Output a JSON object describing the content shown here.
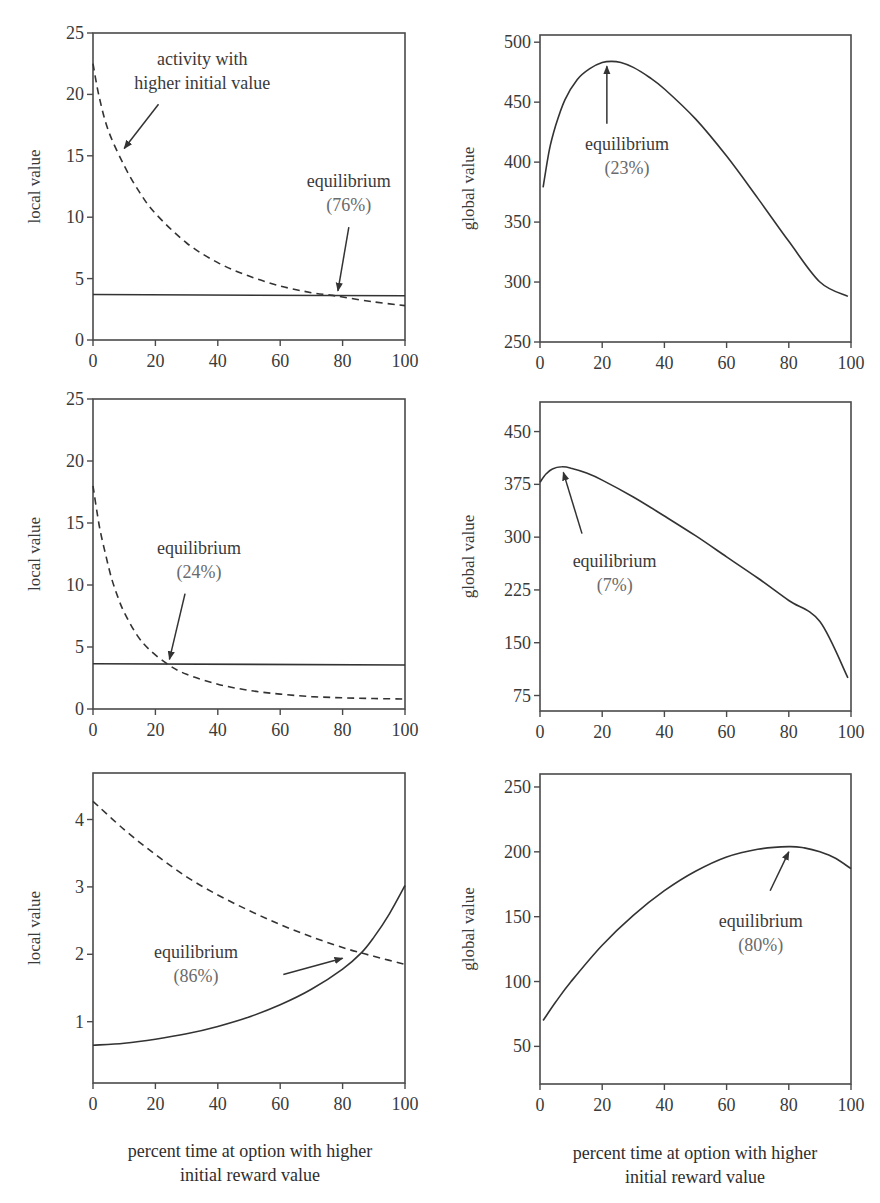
{
  "figure": {
    "x_caption_line1": "percent time at option with higher",
    "x_caption_line2": "initial reward value"
  },
  "chart_data": [
    {
      "id": "top-left",
      "type": "line",
      "title": "",
      "xlabel": "percent time at option with higher initial reward value",
      "ylabel": "local value",
      "xlim": [
        0,
        100
      ],
      "ylim": [
        0,
        25
      ],
      "xticks": [
        0,
        20,
        40,
        60,
        80,
        100
      ],
      "yticks": [
        0,
        5,
        10,
        15,
        20,
        25
      ],
      "grid": false,
      "series": [
        {
          "name": "activity with higher initial value",
          "style": "dashed",
          "x": [
            0,
            2,
            5,
            10,
            15,
            20,
            30,
            40,
            50,
            60,
            70,
            76,
            80,
            90,
            100
          ],
          "y": [
            22.5,
            19.8,
            17.0,
            14.2,
            12.0,
            10.3,
            7.9,
            6.3,
            5.2,
            4.4,
            3.85,
            3.66,
            3.5,
            3.1,
            2.8
          ]
        },
        {
          "name": "other activity",
          "style": "solid",
          "x": [
            0,
            100
          ],
          "y": [
            3.7,
            3.6
          ]
        }
      ],
      "annotations": [
        {
          "text": "activity with",
          "text2": "higher initial value",
          "tx": 35,
          "ty": 22.4,
          "ax": 21,
          "ay": 19.2,
          "hx": 10,
          "hy": 15.6
        },
        {
          "text": "equilibrium",
          "text2": "(76%)",
          "tx": 82,
          "ty": 12.5,
          "ax": 82,
          "ay": 9.2,
          "hx": 78.5,
          "hy": 4.0
        }
      ],
      "box": {
        "left": 93,
        "top": 33,
        "width": 312,
        "height": 307
      }
    },
    {
      "id": "top-right",
      "type": "line",
      "title": "",
      "xlabel": "percent time at option with higher initial reward value",
      "ylabel": "global value",
      "xlim": [
        0,
        100
      ],
      "ylim": [
        250,
        506
      ],
      "xticks": [
        0,
        20,
        40,
        60,
        80,
        100
      ],
      "yticks": [
        250,
        300,
        350,
        400,
        450,
        500
      ],
      "grid": false,
      "series": [
        {
          "name": "global value",
          "style": "solid",
          "x": [
            1,
            3,
            5,
            8,
            12,
            16,
            20,
            23,
            26,
            30,
            35,
            40,
            50,
            60,
            70,
            80,
            90,
            99
          ],
          "y": [
            379,
            410,
            430,
            452,
            469,
            478,
            483,
            484,
            483,
            479,
            471,
            461,
            436,
            405,
            370,
            334,
            300,
            288
          ]
        },
        {
          "name": "",
          "style": "none",
          "x": [],
          "y": []
        }
      ],
      "annotations": [
        {
          "text": "equilibrium",
          "text2": "(23%)",
          "tx": 28,
          "ty": 410,
          "ax": 21.5,
          "ay": 432,
          "hx": 21.5,
          "hy": 480,
          "arrowhead": "up"
        }
      ],
      "box": {
        "left": 540,
        "top": 35,
        "width": 311,
        "height": 307
      }
    },
    {
      "id": "middle-left",
      "type": "line",
      "title": "",
      "xlabel": "percent time at option with higher initial reward value",
      "ylabel": "local value",
      "xlim": [
        0,
        100
      ],
      "ylim": [
        0,
        25
      ],
      "xticks": [
        0,
        20,
        40,
        60,
        80,
        100
      ],
      "yticks": [
        0,
        5,
        10,
        15,
        20,
        25
      ],
      "grid": false,
      "series": [
        {
          "name": "activity with higher initial value",
          "style": "dashed",
          "x": [
            0,
            2,
            4,
            6,
            8,
            10,
            14,
            18,
            24,
            30,
            40,
            50,
            60,
            70,
            80,
            90,
            100
          ],
          "y": [
            18.0,
            14.8,
            12.5,
            10.5,
            9.0,
            7.8,
            6.0,
            4.8,
            3.6,
            2.8,
            2.0,
            1.5,
            1.2,
            1.0,
            0.9,
            0.85,
            0.8
          ]
        },
        {
          "name": "other activity",
          "style": "solid",
          "x": [
            0,
            100
          ],
          "y": [
            3.65,
            3.55
          ]
        }
      ],
      "annotations": [
        {
          "text": "equilibrium",
          "text2": "(24%)",
          "tx": 34,
          "ty": 12.5,
          "ax": 29.5,
          "ay": 9.3,
          "hx": 24.5,
          "hy": 4.0
        }
      ],
      "box": {
        "left": 93,
        "top": 399,
        "width": 312,
        "height": 310
      }
    },
    {
      "id": "middle-right",
      "type": "line",
      "title": "",
      "xlabel": "percent time at option with higher initial reward value",
      "ylabel": "global value",
      "xlim": [
        0,
        100
      ],
      "ylim": [
        53,
        492
      ],
      "xticks": [
        0,
        20,
        40,
        60,
        80,
        100
      ],
      "yticks": [
        75,
        150,
        225,
        300,
        375,
        450
      ],
      "grid": false,
      "series": [
        {
          "name": "global value",
          "style": "solid",
          "x": [
            0,
            2,
            4,
            7,
            10,
            15,
            20,
            30,
            40,
            50,
            60,
            70,
            80,
            90,
            99
          ],
          "y": [
            378,
            390,
            397,
            400,
            398,
            391,
            381,
            357,
            330,
            302,
            272,
            242,
            210,
            180,
            100
          ]
        },
        {
          "name": "",
          "style": "none",
          "x": [],
          "y": []
        }
      ],
      "annotations": [
        {
          "text": "equilibrium",
          "text2": "(7%)",
          "tx": 24,
          "ty": 258,
          "ax": 13.5,
          "ay": 305,
          "hx": 7.5,
          "hy": 392
        }
      ],
      "box": {
        "left": 540,
        "top": 402,
        "width": 311,
        "height": 309
      }
    },
    {
      "id": "bottom-left",
      "type": "line",
      "title": "",
      "xlabel": "percent time at option with higher initial reward value",
      "ylabel": "local value",
      "xlim": [
        0,
        100
      ],
      "ylim": [
        0.09,
        4.69
      ],
      "xticks": [
        0,
        20,
        40,
        60,
        80,
        100
      ],
      "yticks": [
        1,
        2,
        3,
        4
      ],
      "grid": false,
      "series": [
        {
          "name": "activity with higher initial value",
          "style": "dashed",
          "x": [
            0,
            10,
            20,
            30,
            40,
            50,
            60,
            70,
            80,
            86,
            90,
            100
          ],
          "y": [
            4.27,
            3.85,
            3.48,
            3.15,
            2.88,
            2.65,
            2.44,
            2.26,
            2.1,
            2.02,
            1.97,
            1.85
          ]
        },
        {
          "name": "other activity",
          "style": "solid",
          "x": [
            0,
            10,
            20,
            30,
            40,
            50,
            60,
            70,
            80,
            86,
            90,
            95,
            100
          ],
          "y": [
            0.65,
            0.68,
            0.74,
            0.82,
            0.93,
            1.07,
            1.25,
            1.48,
            1.78,
            2.02,
            2.25,
            2.6,
            3.02
          ]
        }
      ],
      "annotations": [
        {
          "text": "equilibrium",
          "text2": "(86%)",
          "tx": 33,
          "ty": 1.95,
          "ax": 61,
          "ay": 1.7,
          "hx": 80,
          "hy": 1.94
        }
      ],
      "box": {
        "left": 93,
        "top": 773,
        "width": 312,
        "height": 310
      }
    },
    {
      "id": "bottom-right",
      "type": "line",
      "title": "",
      "xlabel": "percent time at option with higher initial reward value",
      "ylabel": "global value",
      "xlim": [
        0,
        100
      ],
      "ylim": [
        21,
        260
      ],
      "xticks": [
        0,
        20,
        40,
        60,
        80,
        100
      ],
      "yticks": [
        50,
        100,
        150,
        200,
        250
      ],
      "grid": false,
      "series": [
        {
          "name": "global value",
          "style": "solid",
          "x": [
            1,
            5,
            10,
            20,
            30,
            40,
            50,
            60,
            70,
            80,
            85,
            90,
            95,
            100
          ],
          "y": [
            70,
            84,
            100,
            128,
            151,
            170,
            185,
            196,
            202,
            204,
            203,
            200,
            195,
            187
          ]
        },
        {
          "name": "",
          "style": "none",
          "x": [],
          "y": []
        }
      ],
      "annotations": [
        {
          "text": "equilibrium",
          "text2": "(80%)",
          "tx": 71,
          "ty": 142,
          "ax": 74,
          "ay": 170,
          "hx": 80,
          "hy": 200
        }
      ],
      "box": {
        "left": 540,
        "top": 774,
        "width": 311,
        "height": 310
      }
    }
  ]
}
